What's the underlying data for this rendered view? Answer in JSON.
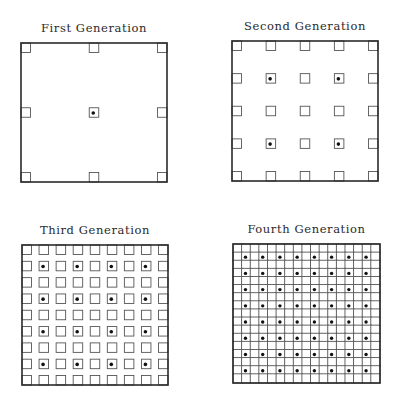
{
  "figure": {
    "panels": [
      {
        "id": "gen1",
        "title": "First Generation",
        "squares_per_side": 3,
        "dot_rule": "center only",
        "box": {
          "x": 21,
          "y": 43,
          "w": 146,
          "h": 139
        },
        "title_y": 32
      },
      {
        "id": "gen2",
        "title": "Second Generation",
        "squares_per_side": 5,
        "dot_rule": "odd interior indices (2x2 dots)",
        "box": {
          "x": 232,
          "y": 41,
          "w": 146,
          "h": 140
        },
        "title_y": 30
      },
      {
        "id": "gen3",
        "title": "Third Generation",
        "squares_per_side": 9,
        "dot_rule": "odd interior indices (4x4 dots)",
        "box": {
          "x": 22,
          "y": 245,
          "w": 146,
          "h": 140
        },
        "title_y": 234
      },
      {
        "id": "gen4",
        "title": "Fourth Generation",
        "squares_per_side": 17,
        "dot_rule": "odd interior indices (8x8 dots)",
        "box": {
          "x": 233,
          "y": 244,
          "w": 147,
          "h": 139
        },
        "title_y": 233
      }
    ],
    "colors": {
      "background": "#ffffff",
      "outline": "#2b2b2b",
      "cell_stroke": "#555555",
      "dot": "#111111",
      "text": "#2a2a2a"
    }
  }
}
